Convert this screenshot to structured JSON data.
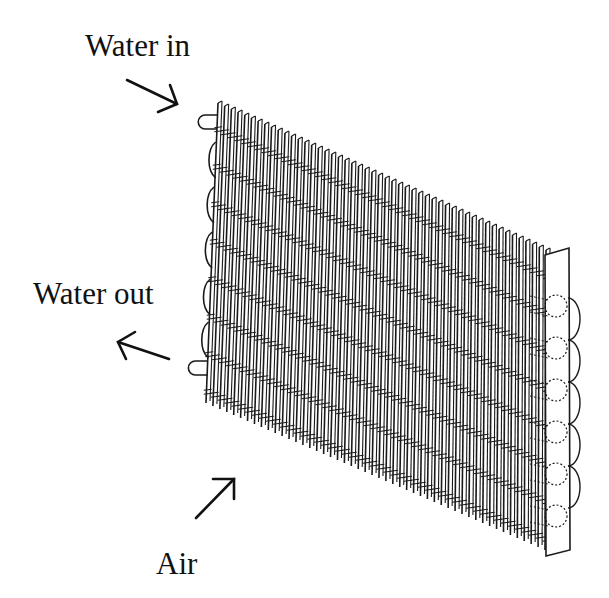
{
  "figure": {
    "labels": {
      "water_in": "Water in",
      "water_out": "Water out",
      "air": "Air"
    },
    "arrows": [
      {
        "name": "water-in-arrow",
        "direction": "down-right"
      },
      {
        "name": "water-out-arrow",
        "direction": "left"
      },
      {
        "name": "air-arrow",
        "direction": "up-right"
      }
    ],
    "coil": {
      "fin_count": 50,
      "tube_passes": 8,
      "left_bends": 5,
      "right_bends": 5,
      "line_color": "#1a1a1a",
      "background": "#ffffff"
    }
  }
}
